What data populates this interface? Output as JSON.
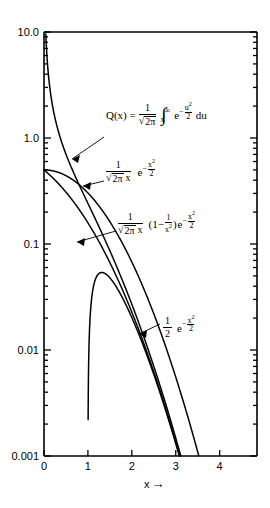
{
  "chart_data": {
    "type": "line",
    "title": "",
    "xlabel": "x",
    "ylabel": "",
    "xlim": [
      0,
      4.85
    ],
    "ylim": [
      0.001,
      10.0
    ],
    "yscale": "log",
    "xscale": "linear",
    "grid": false,
    "legend": "none",
    "x_ticks": [
      "0",
      "1",
      "2",
      "3",
      "4"
    ],
    "x_tick_values": [
      0,
      1,
      2,
      3,
      4
    ],
    "y_ticks": [
      "10.0",
      "1.0",
      "0.1",
      "0.01",
      "0.001"
    ],
    "y_tick_values": [
      10.0,
      1.0,
      0.1,
      0.01,
      0.001
    ],
    "series": [
      {
        "name": "Q(x)",
        "formula": "Q(x) = (1/sqrt(2*pi)) * integral_x^inf exp(-u^2/2) du",
        "x": [
          0,
          0.2,
          0.4,
          0.6,
          0.8,
          1.0,
          1.2,
          1.4,
          1.6,
          1.8,
          2.0,
          2.2,
          2.4,
          2.6,
          2.8,
          3.0,
          3.1
        ],
        "values": [
          0.5,
          0.4207,
          0.3446,
          0.2743,
          0.2119,
          0.1587,
          0.1151,
          0.0808,
          0.0548,
          0.0359,
          0.02275,
          0.0139,
          0.0082,
          0.00466,
          0.00256,
          0.00135,
          0.000968
        ]
      },
      {
        "name": "1/(sqrt(2 pi) x) e^(-x^2/2)",
        "formula": "(1/(sqrt(2*pi)*x)) * exp(-x^2/2)",
        "x": [
          0.11,
          0.2,
          0.4,
          0.6,
          0.8,
          1.0,
          1.2,
          1.4,
          1.6,
          1.8,
          2.0,
          2.2,
          2.4,
          2.6
        ],
        "values": [
          3.604,
          1.954,
          0.923,
          0.5561,
          0.3606,
          0.242,
          0.1658,
          0.1153,
          0.081,
          0.0574,
          0.027,
          0.0161,
          0.00971,
          0.0059
        ]
      },
      {
        "name": "1/(sqrt(2 pi) x) (1 - 1/x^2) e^(-x^2/2)",
        "formula": "(1/(sqrt(2*pi)*x)) * (1 - 1/x^2) * exp(-x^2/2)",
        "x": [
          0.62,
          0.7,
          0.8,
          0.9,
          1.0,
          1.2,
          1.4,
          1.6,
          1.8,
          2.0,
          2.2,
          2.4,
          2.55
        ],
        "values": [
          0.093,
          0.1101,
          0.1157,
          0.1097,
          0.0,
          0.0507,
          0.0565,
          0.0493,
          0.0397,
          0.0237,
          0.0128,
          0.00802,
          0.00544
        ]
      },
      {
        "name": "(1/2) e^(-x^2/2)",
        "formula": "0.5 * exp(-x^2/2)",
        "x": [
          0,
          0.4,
          0.8,
          1.2,
          1.6,
          2.0,
          2.4,
          2.8,
          3.2,
          3.4
        ],
        "values": [
          0.5,
          0.4608,
          0.3627,
          0.2431,
          0.139,
          0.0677,
          0.028,
          0.00989,
          0.00298,
          0.00155
        ]
      }
    ],
    "annotations": [
      {
        "id": "annotation-q-definition",
        "text": "Q(x) = 1/√(2π) ∫ₓ^∞ e^(-u²/2) du",
        "target_curve": "Q(x)"
      },
      {
        "id": "annotation-upper-bound",
        "text": "1/(√(2π) x) e^(-x²/2)",
        "target_curve": "1/(sqrt(2 pi) x) e^(-x^2/2)"
      },
      {
        "id": "annotation-lower-bound",
        "text": "1/(√(2π) x) (1- 1/x²) e^(-x²/2)",
        "target_curve": "1/(sqrt(2 pi) x) (1 - 1/x^2) e^(-x^2/2)"
      },
      {
        "id": "annotation-chernoff-bound",
        "text": "1/2 e^(-x²/2)",
        "target_curve": "(1/2) e^(-x^2/2)"
      }
    ]
  },
  "axes": {
    "x_axis_label": "x",
    "x_axis_arrow": "→",
    "x_tick_labels": [
      "0",
      "1",
      "2",
      "3",
      "4"
    ],
    "y_tick_labels": [
      "10.0",
      "1.0",
      "0.1",
      "0.01",
      "0.001"
    ]
  },
  "formula_parts": {
    "q_lhs": "Q(x) =",
    "q_num": "1",
    "q_den_sqrt": "√",
    "q_den_body": "2π",
    "q_integral": "∫",
    "q_int_upper": "∞",
    "q_int_lower": "x",
    "q_e": "e",
    "q_minus": "−",
    "q_exp_num": "u",
    "q_exp_sup": "2",
    "q_exp_den": "2",
    "q_du": "du",
    "f2_num": "1",
    "f2_den_sqrt": "√",
    "f2_den_body": "2π",
    "f2_den_x": "x",
    "f2_e": "e",
    "f2_minus": "−",
    "f2_exp_num": "x",
    "f2_exp_sup": "2",
    "f2_exp_den": "2",
    "f3_num": "1",
    "f3_den_sqrt": "√",
    "f3_den_body": "2π",
    "f3_den_x": "x",
    "f3_paren_open": "(1−",
    "f3_frac_num": "1",
    "f3_frac_den": "x",
    "f3_frac_den_sup": "2",
    "f3_paren_close": ")",
    "f3_e": "e",
    "f3_minus": "−",
    "f3_exp_num": "x",
    "f3_exp_sup": "2",
    "f3_exp_den": "2",
    "f4_num": "1",
    "f4_den": "2",
    "f4_e": "e",
    "f4_minus": "−",
    "f4_exp_num": "x",
    "f4_exp_sup": "2",
    "f4_exp_den": "2"
  }
}
